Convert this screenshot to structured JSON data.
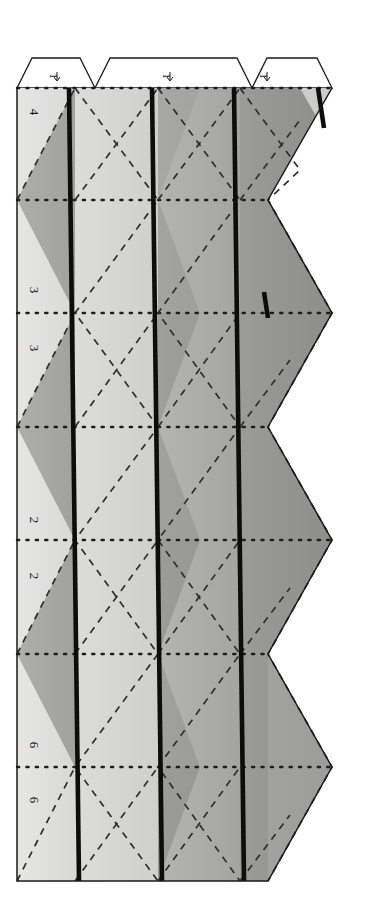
{
  "document": {
    "title": "Polyhedron Net Fold Pattern",
    "orientation": "rotated-90",
    "background_color": "#ffffff"
  },
  "palette": {
    "paper_lightest": "#e3e3e1",
    "paper_light": "#d2d2d0",
    "paper_mid": "#b9b9b7",
    "paper_midgray": "#a8a8a6",
    "paper_dark": "#939391",
    "paper_darkest": "#878785",
    "outline": "#1a1a1a",
    "thick_rule": "#111111",
    "dotted_fold": "#222222",
    "dashed_fold": "#333333"
  },
  "tabs": [
    {
      "id": "glue-tab-1",
      "label": "1"
    },
    {
      "id": "glue-tab-2",
      "label": "1"
    },
    {
      "id": "glue-tab-3",
      "label": "1"
    }
  ],
  "fold_labels": [
    {
      "id": "fold-label-4",
      "label": "4",
      "x": 30,
      "y": 112
    },
    {
      "id": "fold-label-3a",
      "label": "3",
      "x": 30,
      "y": 290
    },
    {
      "id": "fold-label-3b",
      "label": "3",
      "x": 30,
      "y": 348
    },
    {
      "id": "fold-label-2a",
      "label": "2",
      "x": 30,
      "y": 520
    },
    {
      "id": "fold-label-2b",
      "label": "2",
      "x": 30,
      "y": 576
    },
    {
      "id": "fold-label-6a",
      "label": "6",
      "x": 30,
      "y": 745
    },
    {
      "id": "fold-label-6b",
      "label": "6",
      "x": 30,
      "y": 800
    }
  ],
  "geometry": {
    "sheet_left": 17,
    "sheet_right": 332,
    "body_top": 88,
    "body_bottom": 881,
    "tab_top": 58,
    "column_count": 4,
    "row_count": 7,
    "dotted_fold_rows": [
      88,
      200,
      313,
      427,
      540,
      654,
      767,
      881
    ],
    "thick_rule_columns": [
      70,
      154,
      236
    ],
    "zigzag_right_apex_x": 332,
    "zigzag_right_notch_x": 268
  },
  "legend": {
    "solid_line": "cut line",
    "dotted_line": "valley fold",
    "dashed_line": "mountain fold",
    "thick_line": "panel seam"
  }
}
